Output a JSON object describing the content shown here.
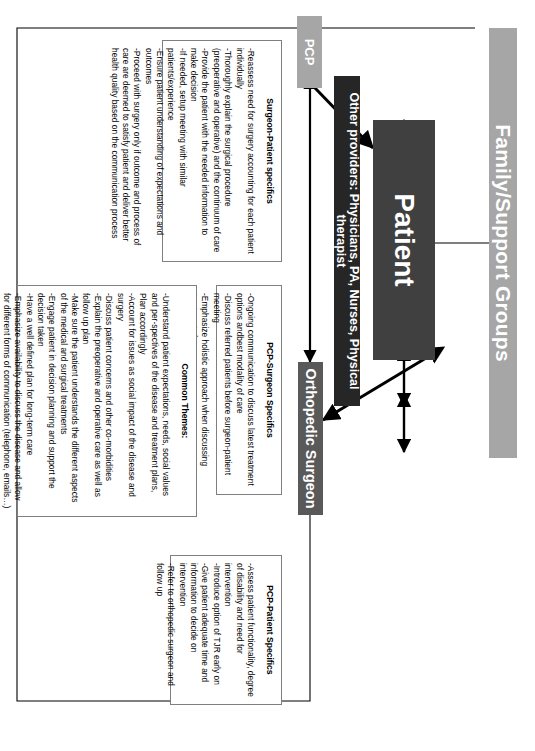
{
  "diagram": {
    "colors": {
      "family_bar": "#a6a6a6",
      "patient_bar": "#404040",
      "other_providers_bar": "#262626",
      "pcp_bar": "#a6a6a6",
      "surgeon_bar": "#595959",
      "panel_border": "#7f7f7f",
      "line": "#000000"
    },
    "nodes": {
      "family": "Family/Support Groups",
      "patient": "Patient",
      "other_providers": "Other providers: Physicians, PA, Nurses, Physical therapist",
      "pcp": "PCP",
      "surgeon": "Orthopedic Surgeon"
    },
    "panels": {
      "surgeon_patient": {
        "title": "Surgeon-Patient specifics",
        "items": [
          "-Reassess need for surgery accounting for each patient individually",
          "-Thoroughly explain the surgical procedure (preoperative and operative) and the continuum of care",
          "-Provide the patient with the needed information to make decision",
          "-If needed, setup meeting with similar patients/experience",
          "-Ensure patient understanding of expectations and outcomes",
          "-Proceed with surgery only if outcome and process of care are deemed to satisfy patient and deliver better health quality based on the communication process"
        ]
      },
      "pcp_surgeon": {
        "title": "PCP-Surgeon Specifics",
        "items": [
          "-Ongoing communication to discuss latest treatment options andbest modality of care",
          "-Discuss referred patients before surgeon-patient meeting",
          "-Emphasize holistic approach when discussing treatment plan",
          "-Stay coherent to avoid patient's confusion"
        ]
      },
      "common_themes": {
        "title": "Common Themes:",
        "items": [
          "-Understand patient expectations, needs, social values and per-spectives of the disease and treatment plans, Plan accordingly",
          "-Account for issues as social impact of the disease and surgery",
          "-Discuss patient concerns and other co-morbidities",
          "-Explain the preoperative and operative care as well as follow up plan",
          "-Make sure the patient understands the different aspects of the medical and surgical treatments",
          "-Engage patient in decision planning and support the decision taken",
          "-Have a well defined plan for long-term care",
          "-Emphasize availability to discuss the disease and allow for different forms of communication (telephone, emails…)"
        ]
      },
      "pcp_patient": {
        "title": "PCP-Patient Specifics",
        "items": [
          "-Assess patient functionality, degree of disability and need for intervention",
          "-Introduce option of TJR early on",
          "-Give patient adequate time and information to decide on intervention",
          "-Refer to orthopedic surgeon and follow up"
        ]
      }
    }
  }
}
